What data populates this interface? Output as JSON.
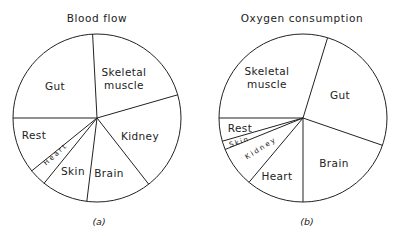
{
  "chart_data": [
    {
      "type": "pie",
      "title": "Blood flow",
      "caption": "(a)",
      "center": [
        97,
        118
      ],
      "radius": 84,
      "slices": [
        {
          "label": "Skeletal muscle",
          "start": 16,
          "end": 93,
          "value": 21
        },
        {
          "label": "Gut",
          "start": 93,
          "end": 180,
          "value": 24
        },
        {
          "label": "Rest",
          "start": 180,
          "end": 219,
          "value": 11
        },
        {
          "label": "Heart",
          "start": 219,
          "end": 231,
          "value": 3
        },
        {
          "label": "Skin",
          "start": 231,
          "end": 263,
          "value": 9
        },
        {
          "label": "Brain",
          "start": 263,
          "end": 308,
          "value": 13
        },
        {
          "label": "Kidney",
          "start": 308,
          "end": 376,
          "value": 19
        }
      ]
    },
    {
      "type": "pie",
      "title": "Oxygen consumption",
      "caption": "(b)",
      "center": [
        303,
        118
      ],
      "radius": 84,
      "slices": [
        {
          "label": "Gut",
          "start": -19,
          "end": 73,
          "value": 26
        },
        {
          "label": "Skeletal muscle",
          "start": 73,
          "end": 180,
          "value": 30
        },
        {
          "label": "Rest",
          "start": 180,
          "end": 196,
          "value": 4
        },
        {
          "label": "Skin",
          "start": 196,
          "end": 202,
          "value": 2
        },
        {
          "label": "Kidney",
          "start": 202,
          "end": 230,
          "value": 8
        },
        {
          "label": "Heart",
          "start": 230,
          "end": 270,
          "value": 11
        },
        {
          "label": "Brain",
          "start": 270,
          "end": 341,
          "value": 20
        }
      ]
    }
  ],
  "labels": {
    "a": {
      "title": "Blood flow",
      "gut": "Gut",
      "skeletal1": "Skeletal",
      "skeletal2": "muscle",
      "kidney": "Kidney",
      "brain": "Brain",
      "skin": "Skin",
      "rest": "Rest",
      "heart": "Heart",
      "caption": "(a)"
    },
    "b": {
      "title": "Oxygen consumption",
      "skeletal1": "Skeletal",
      "skeletal2": "muscle",
      "gut": "Gut",
      "brain": "Brain",
      "heart": "Heart",
      "rest": "Rest",
      "skin": "Skin",
      "kidney": "Kidney",
      "caption": "(b)"
    }
  }
}
